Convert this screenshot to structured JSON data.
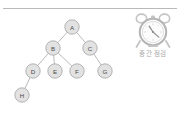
{
  "slide": {
    "background_color": "#ffffff",
    "rule_color": "#b9b9b9"
  },
  "tree": {
    "title": "",
    "node_fill": "#e2e2e2",
    "node_stroke": "#9a9a9a",
    "edge_color": "#a8a8a8",
    "nodes": [
      {
        "id": "A",
        "label": "A",
        "x": 72,
        "y": 27
      },
      {
        "id": "B",
        "label": "B",
        "x": 53,
        "y": 48
      },
      {
        "id": "C",
        "label": "C",
        "x": 90,
        "y": 48
      },
      {
        "id": "D",
        "label": "D",
        "x": 33,
        "y": 71
      },
      {
        "id": "E",
        "label": "E",
        "x": 55,
        "y": 71
      },
      {
        "id": "F",
        "label": "F",
        "x": 77,
        "y": 71
      },
      {
        "id": "G",
        "label": "G",
        "x": 105,
        "y": 71
      },
      {
        "id": "H",
        "label": "H",
        "x": 22,
        "y": 95
      }
    ],
    "edges": [
      {
        "from": "A",
        "to": "B"
      },
      {
        "from": "A",
        "to": "C"
      },
      {
        "from": "B",
        "to": "D"
      },
      {
        "from": "B",
        "to": "E"
      },
      {
        "from": "B",
        "to": "F"
      },
      {
        "from": "C",
        "to": "G"
      },
      {
        "from": "D",
        "to": "H"
      }
    ],
    "node_radius": 7.2
  },
  "clock": {
    "icon_name": "alarm-clock-icon",
    "caption": "중간 점검",
    "caption_color": "#a9a9a9",
    "icon_color": "#bdbdbd",
    "hour_hand": 11,
    "minute_hand": 4,
    "face_numbers": [
      "12",
      "3",
      "6",
      "9"
    ]
  }
}
